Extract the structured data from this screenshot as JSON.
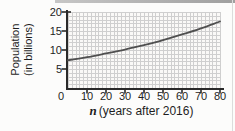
{
  "figure": {
    "kind": "line-graph"
  },
  "chart": {
    "ylabel_line1": "Population",
    "ylabel_line2": "(in billions)",
    "xlabel_var": "n",
    "xlabel_rest": "(years after 2016)"
  },
  "colors": {
    "background": "#fcfcfb",
    "plot_background": "#faf9f7",
    "grid": "#cfcfcf",
    "axis": "#2a2a2a",
    "curve": "#4f4f4f",
    "text": "#1e1e1e",
    "scan_shadow": "#9e9e9e"
  },
  "chart_data": {
    "type": "line",
    "title": "",
    "xlabel": "n (years after 2016)",
    "ylabel": "Population (in billions)",
    "x": [
      0,
      10,
      20,
      30,
      40,
      50,
      60,
      70,
      80
    ],
    "series": [
      {
        "name": "population",
        "values": [
          7.3,
          8.1,
          9.1,
          10.1,
          11.3,
          12.6,
          14.1,
          15.7,
          17.5
        ]
      }
    ],
    "xlim": [
      0,
      80
    ],
    "ylim": [
      0,
      20
    ],
    "xticks": [
      0,
      10,
      20,
      30,
      40,
      50,
      60,
      70,
      80
    ],
    "yticks": [
      0,
      5,
      10,
      15,
      20
    ],
    "grid": "minor",
    "minor_x_step": 2,
    "minor_y_step": 1,
    "legend": false
  }
}
